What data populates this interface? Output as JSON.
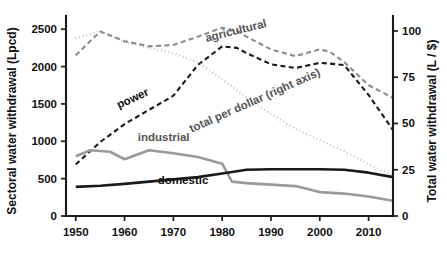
{
  "chart_data": {
    "type": "line",
    "title": "",
    "xlabel": "",
    "ylabel": "Sectoral water withdrawal (Lpcd)",
    "y2label": "Total water withdrawal (L / $)",
    "xlim": [
      1948,
      2015
    ],
    "ylim": [
      0,
      2650
    ],
    "y2lim": [
      0,
      107
    ],
    "grid": false,
    "legend": "inline-annotations",
    "xticks": [
      1950,
      1960,
      1970,
      1980,
      1990,
      2000,
      2010
    ],
    "xticklabels": [
      "1950",
      "1960",
      "1970",
      "1980",
      "1990",
      "2000",
      "2010"
    ],
    "yticks": [
      0,
      500,
      1000,
      1500,
      2000,
      2500
    ],
    "yticklabels": [
      "0",
      "500",
      "1000",
      "1500",
      "2000",
      "2500"
    ],
    "y2ticks": [
      0,
      25,
      50,
      75,
      100
    ],
    "y2ticklabels": [
      "0",
      "25",
      "50",
      "75",
      "100"
    ],
    "series": [
      {
        "name": "agricultural",
        "label": "agricultural",
        "axis": "left",
        "color": "#8c8c8c",
        "style": "dashed",
        "width": 2.1,
        "label_x": 1983,
        "label_y": 2430,
        "label_rotate": -14,
        "x": [
          1950,
          1955,
          1960,
          1965,
          1970,
          1975,
          1980,
          1983,
          1985,
          1990,
          1995,
          2000,
          2002,
          2005,
          2010,
          2015
        ],
        "y": [
          2150,
          2470,
          2340,
          2270,
          2290,
          2400,
          2520,
          2480,
          2400,
          2230,
          2140,
          2230,
          2200,
          2060,
          1750,
          1580
        ]
      },
      {
        "name": "power",
        "label": "power",
        "axis": "left",
        "color": "#1a1a1a",
        "style": "dashed",
        "width": 2.1,
        "label_x": 1962,
        "label_y": 1530,
        "label_rotate": -25,
        "x": [
          1950,
          1955,
          1960,
          1965,
          1970,
          1975,
          1980,
          1983,
          1985,
          1990,
          1995,
          2000,
          2002,
          2005,
          2010,
          2015
        ],
        "y": [
          690,
          990,
          1230,
          1420,
          1610,
          2020,
          2270,
          2250,
          2180,
          2030,
          1980,
          2050,
          2040,
          2020,
          1620,
          1150
        ]
      },
      {
        "name": "total-per-dollar",
        "label": "total per dollar (right axis)",
        "axis": "right",
        "color": "#9a9a9a",
        "style": "dotted",
        "width": 2.1,
        "label_x": 1987,
        "label_y": 1500,
        "label_rotate": -24,
        "x": [
          1950,
          1955,
          1960,
          1965,
          1970,
          1975,
          1980,
          1985,
          1990,
          1995,
          2000,
          2005,
          2010,
          2015
        ],
        "y2": [
          96,
          100,
          94,
          91,
          88,
          83,
          74,
          64,
          55,
          47,
          41,
          35,
          28,
          22
        ]
      },
      {
        "name": "industrial",
        "label": "industrial",
        "axis": "left",
        "color": "#9a9a9a",
        "style": "solid",
        "width": 2.6,
        "label_x": 1968,
        "label_y": 1000,
        "label_rotate": 0,
        "x": [
          1950,
          1953,
          1957,
          1960,
          1965,
          1970,
          1975,
          1980,
          1982,
          1985,
          1990,
          1995,
          2000,
          2005,
          2010,
          2015
        ],
        "y": [
          800,
          880,
          860,
          760,
          880,
          840,
          790,
          700,
          460,
          440,
          420,
          400,
          320,
          300,
          260,
          205
        ]
      },
      {
        "name": "domestic",
        "label": "domestic",
        "axis": "left",
        "color": "#1a1a1a",
        "style": "solid",
        "width": 2.6,
        "label_x": 1972,
        "label_y": 430,
        "label_rotate": 0,
        "x": [
          1950,
          1955,
          1960,
          1965,
          1970,
          1975,
          1980,
          1985,
          1990,
          1995,
          2000,
          2005,
          2010,
          2015
        ],
        "y": [
          390,
          405,
          430,
          460,
          490,
          520,
          570,
          620,
          625,
          625,
          625,
          620,
          580,
          520
        ]
      }
    ]
  }
}
